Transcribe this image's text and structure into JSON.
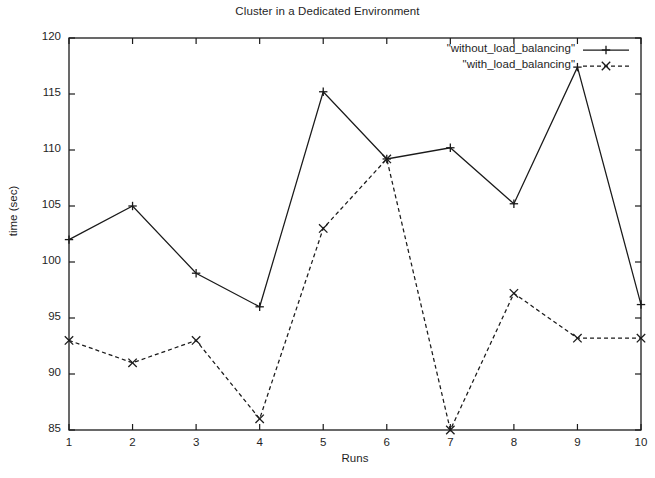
{
  "chart_data": {
    "type": "line",
    "title": "Cluster in a Dedicated Environment",
    "xlabel": "Runs",
    "ylabel": "time (sec)",
    "x": [
      1,
      2,
      3,
      4,
      5,
      6,
      7,
      8,
      9,
      10
    ],
    "xlim": [
      1,
      10
    ],
    "ylim": [
      85,
      120
    ],
    "xticks": [
      "1",
      "2",
      "3",
      "4",
      "5",
      "6",
      "7",
      "8",
      "9",
      "10"
    ],
    "yticks": [
      "85",
      "90",
      "95",
      "100",
      "105",
      "110",
      "115",
      "120"
    ],
    "ytick_values": [
      85,
      90,
      95,
      100,
      105,
      110,
      115,
      120
    ],
    "grid": false,
    "legend_position": "top-right-inside",
    "series": [
      {
        "name": "\"without_load_balancing\"",
        "linestyle": "solid",
        "marker": "plus",
        "color": "#1a1a1a",
        "values": [
          102,
          105,
          99,
          96,
          115.2,
          109.2,
          110.2,
          105.2,
          117.4,
          96.2
        ]
      },
      {
        "name": "\"with_load_balancing\"",
        "linestyle": "dashed",
        "marker": "cross",
        "color": "#1a1a1a",
        "values": [
          93,
          91,
          93,
          86,
          103,
          109.2,
          85,
          97.2,
          93.2,
          93.2
        ]
      }
    ]
  },
  "legend": {
    "entries": [
      {
        "label": "\"without_load_balancing\""
      },
      {
        "label": "\"with_load_balancing\""
      }
    ]
  },
  "axes": {
    "frame_color": "#1a1a1a"
  }
}
